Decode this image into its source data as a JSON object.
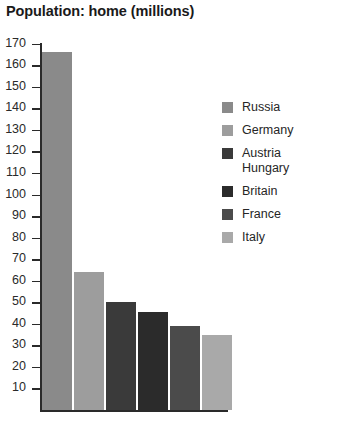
{
  "chart_data": {
    "type": "bar",
    "title": "Population: home (millions)",
    "xlabel": "",
    "ylabel": "",
    "ylim": [
      0,
      175
    ],
    "grid": false,
    "legend_position": "right",
    "y_ticks": [
      170,
      160,
      150,
      140,
      130,
      120,
      110,
      100,
      90,
      80,
      70,
      60,
      50,
      40,
      30,
      20,
      10
    ],
    "categories": [
      "Russia",
      "Germany",
      "Austria Hungary",
      "Britain",
      "France",
      "Italy"
    ],
    "values": [
      166,
      64,
      50,
      45.5,
      39,
      35
    ],
    "colors": [
      "#8a8a8a",
      "#9d9d9d",
      "#3a3a3a",
      "#2b2b2b",
      "#4b4b4b",
      "#a9a9a9"
    ],
    "series": [
      {
        "name": "Population: home (millions)",
        "values": [
          166,
          64,
          50,
          45.5,
          39,
          35
        ]
      }
    ]
  },
  "legend": {
    "items": [
      {
        "label": "Russia",
        "color": "#8a8a8a"
      },
      {
        "label": "Germany",
        "color": "#9d9d9d"
      },
      {
        "label": "Austria\nHungary",
        "color": "#3a3a3a"
      },
      {
        "label": "Britain",
        "color": "#2b2b2b"
      },
      {
        "label": "France",
        "color": "#4b4b4b"
      },
      {
        "label": "Italy",
        "color": "#a9a9a9"
      }
    ]
  }
}
